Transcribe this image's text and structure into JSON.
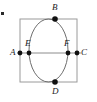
{
  "figure": {
    "canvas": {
      "width": 97,
      "height": 102,
      "background": "#ffffff"
    },
    "colors": {
      "square_stroke": "#9a9a9a",
      "ellipse_stroke": "#6e6e6e",
      "axis_stroke": "#8c8c8c",
      "point_fill": "#111111",
      "label_text": "#1a1a1a"
    },
    "square": {
      "name": "bounding-square",
      "left": 20,
      "top": 19,
      "right": 77,
      "bottom": 82,
      "stroke_width": 1
    },
    "ellipse": {
      "name": "inscribed-ellipse",
      "cx": 48.5,
      "cy": 50.5,
      "rx": 19.5,
      "ry": 31.5,
      "stroke_width": 1
    },
    "horizontal_line": {
      "name": "horizontal-axis",
      "x1": 17,
      "x2": 81,
      "y": 53,
      "stroke_width": 1
    },
    "points": [
      {
        "id": "A",
        "label": "A",
        "x": 20,
        "y": 53,
        "radius": 2.4,
        "label_x": 10,
        "label_y": 48,
        "role": "square-left-edge"
      },
      {
        "id": "E",
        "label": "E",
        "x": 29,
        "y": 53,
        "radius": 2.4,
        "label_x": 25,
        "label_y": 39,
        "role": "ellipse-left-vertex"
      },
      {
        "id": "F",
        "label": "F",
        "x": 68,
        "y": 53,
        "radius": 2.4,
        "label_x": 64,
        "label_y": 39,
        "role": "ellipse-right-vertex"
      },
      {
        "id": "C",
        "label": "C",
        "x": 77,
        "y": 53,
        "radius": 2.4,
        "label_x": 81,
        "label_y": 48,
        "role": "square-right-edge"
      },
      {
        "id": "B",
        "label": "B",
        "x": 55,
        "y": 19,
        "radius": 2.8,
        "label_x": 52,
        "label_y": 3,
        "role": "top-point"
      },
      {
        "id": "D",
        "label": "D",
        "x": 55,
        "y": 82,
        "radius": 2.8,
        "label_x": 52,
        "label_y": 87,
        "role": "bottom-point"
      }
    ],
    "stray_mark": {
      "name": "stray-dot",
      "x": 1,
      "y": 12,
      "width": 3,
      "height": 3,
      "color": "#2a2a2a"
    }
  }
}
